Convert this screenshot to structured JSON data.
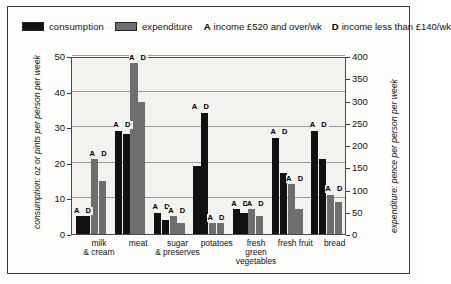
{
  "legend": {
    "series": [
      {
        "name": "consumption",
        "label": "consumption",
        "color": "#111111",
        "swatch": "consumption-swatch"
      },
      {
        "name": "expenditure",
        "label": "expenditure",
        "color": "#6e6e6e",
        "swatch": "expenditure-swatch"
      }
    ],
    "keys": [
      {
        "code": "A",
        "text": "income £520 and over/wk"
      },
      {
        "code": "D",
        "text": "income less than £140/wk"
      }
    ]
  },
  "chart_data": {
    "type": "bar",
    "title": "",
    "categories": [
      "milk\n& cream",
      "meat",
      "sugar\n& preserves",
      "potatoes",
      "fresh\ngreen\nvegetables",
      "fresh fruit",
      "bread"
    ],
    "group_keys": [
      "A",
      "D"
    ],
    "series": [
      {
        "name": "consumption",
        "axis": "left",
        "color": "#111111",
        "values_A": [
          5,
          29,
          6,
          19,
          7,
          27,
          29
        ],
        "values_D": [
          5,
          28,
          4,
          34,
          6,
          17,
          21
        ]
      },
      {
        "name": "expenditure",
        "axis": "right",
        "color": "#6e6e6e",
        "values_A": [
          21,
          48,
          5,
          3,
          7,
          14,
          11
        ],
        "values_D": [
          15,
          37,
          3,
          3,
          5,
          7,
          9
        ]
      }
    ],
    "xlabel": "",
    "ylabel_left": "consumption: oz or pints per person per week",
    "ylabel_right": "expenditure: pence per person per week",
    "ylim_left": [
      0,
      50
    ],
    "ylim_right": [
      0,
      400
    ],
    "yticks_left": [
      "0",
      "10",
      "20",
      "30",
      "40",
      "50"
    ],
    "yticks_right": [
      "0",
      "50",
      "100",
      "150",
      "200",
      "250",
      "300",
      "350",
      "400"
    ],
    "grid": true,
    "legend_position": "top"
  }
}
